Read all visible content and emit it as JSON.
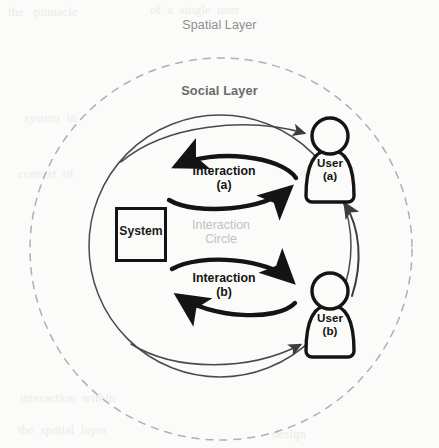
{
  "diagram": {
    "title_spatial": "Spatial Layer",
    "title_social": "Social Layer",
    "system_label": "System",
    "interaction_circle_label": "Interaction\nCircle",
    "interaction_a_label": "Interaction\n(a)",
    "interaction_b_label": "Interaction\n(b)",
    "user_a_label": "User\n(a)",
    "user_b_label": "User\n(b)",
    "colors": {
      "page_background": "#fbfbf9",
      "ink": "#141414",
      "social_circle_stroke": "#4a4a4a",
      "spatial_dashed_stroke": "#b0b0b0",
      "faint_label": "#c2c2c2",
      "spatial_label_text": "#8e8e8e",
      "social_label_text": "#6b6b6b"
    },
    "geometry": {
      "spatial_circle_center": [
        221,
        249
      ],
      "spatial_circle_radius": 191,
      "social_circle_center": [
        220,
        246
      ],
      "social_circle_radius": 131,
      "system_box": [
        116,
        208,
        50,
        53
      ],
      "user_a_center": [
        330,
        160
      ],
      "user_b_center": [
        330,
        315
      ]
    },
    "bleed_text": [
      {
        "x": 8,
        "y": 8,
        "text": "the   pinnacle"
      },
      {
        "x": 150,
        "y": 6,
        "text": "of  a  single  user"
      },
      {
        "x": 24,
        "y": 112,
        "text": "system  in"
      },
      {
        "x": 18,
        "y": 168,
        "text": "context  of"
      },
      {
        "x": 300,
        "y": 166,
        "text": "and  social"
      },
      {
        "x": 20,
        "y": 392,
        "text": "interaction  within"
      },
      {
        "x": 18,
        "y": 424,
        "text": "the  spatial  layer"
      },
      {
        "x": 272,
        "y": 428,
        "text": "design"
      }
    ]
  }
}
